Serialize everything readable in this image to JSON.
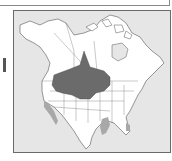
{
  "map": {
    "title": "",
    "region": "North America",
    "legend": [],
    "colors": {
      "ocean": "#e6e6e6",
      "land": "#ffffff",
      "range_primary": "#6b6b6b",
      "range_secondary": "#a8a8a8",
      "borders": "#555555",
      "frame": "#6a6a6a"
    },
    "range_areas": [
      {
        "name": "breeding-range",
        "shade": "dark",
        "description": "Great Plains and interior west, from southern Canadian prairies to northern Great Basin"
      },
      {
        "name": "wintering-range",
        "shade": "light",
        "description": "Pacific coast of California/Baja, Texas Gulf coast, southern Florida"
      }
    ]
  }
}
